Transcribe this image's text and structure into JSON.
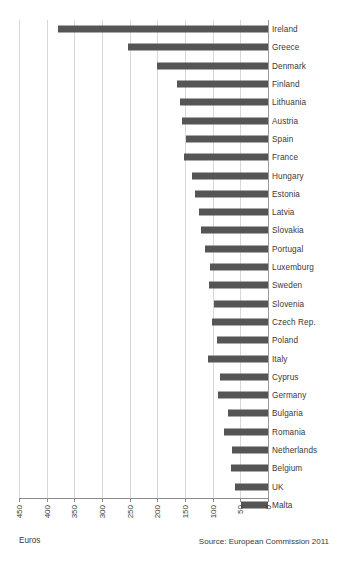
{
  "chart_data": {
    "type": "bar",
    "orientation": "horizontal",
    "title": "",
    "subtitle": "",
    "xlabel": "Euros",
    "ylabel": "",
    "xlim": [
      450,
      0
    ],
    "x_axis_reversed": true,
    "grid": true,
    "legend": null,
    "tick_labels": [
      "450",
      "400",
      "350",
      "300",
      "250",
      "200",
      "150",
      "100",
      "50",
      "0"
    ],
    "tick_values": [
      450,
      400,
      350,
      300,
      250,
      200,
      150,
      100,
      50,
      0
    ],
    "bar_color": "#555555",
    "gridline_color": "#d8d8d8",
    "categories": [
      "Ireland",
      "Greece",
      "Denmark",
      "Finland",
      "Lithuania",
      "Austria",
      "Spain",
      "France",
      "Hungary",
      "Estonia",
      "Latvia",
      "Slovakia",
      "Portugal",
      "Luxemburg",
      "Sweden",
      "Slovenia",
      "Czech Rep.",
      "Poland",
      "Italy",
      "Cyprus",
      "Germany",
      "Bulgaria",
      "Romania",
      "Netherlands",
      "Belgium",
      "UK",
      "Malta"
    ],
    "values": [
      380,
      253,
      201,
      165,
      159,
      156,
      148,
      152,
      137,
      132,
      125,
      121,
      114,
      105,
      107,
      98,
      101,
      92,
      108,
      87,
      90,
      73,
      79,
      65,
      67,
      60,
      49
    ],
    "annotations": {
      "source": "Source: European Commission 2011"
    }
  },
  "axis": {
    "xlabel": "Euros"
  },
  "footer": {
    "source": "Source: European Commission 2011"
  }
}
